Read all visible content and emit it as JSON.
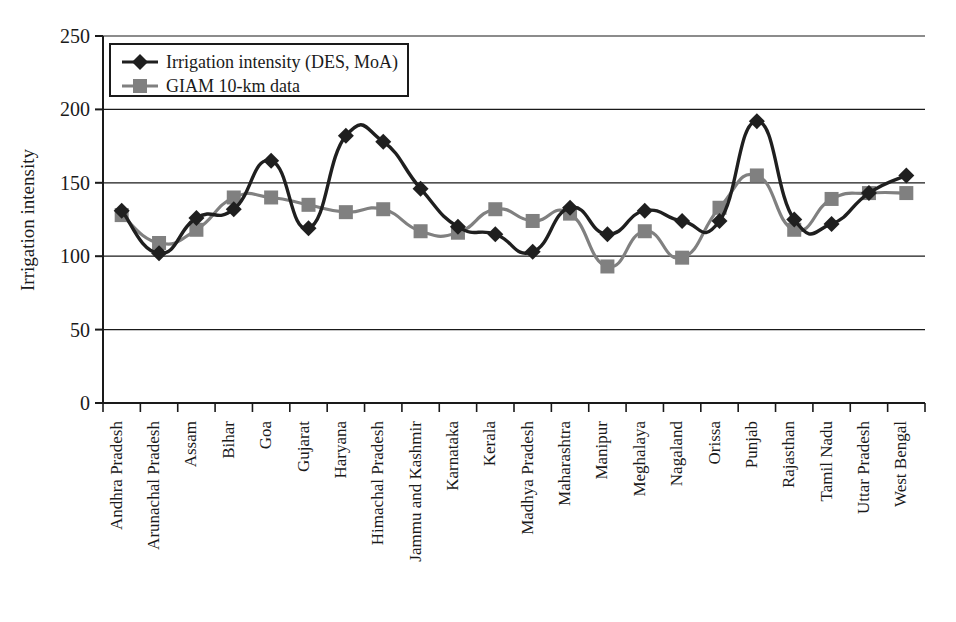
{
  "chart_data": {
    "type": "line",
    "title": "",
    "xlabel": "",
    "ylabel": "Irrigation intensity",
    "ylim": [
      0,
      250
    ],
    "yticks": [
      0,
      50,
      100,
      150,
      200,
      250
    ],
    "grid": true,
    "legend_position": "top-left",
    "categories": [
      "Andhra Pradesh",
      "Arunachal Pradesh",
      "Assam",
      "Bihar",
      "Goa",
      "Gujarat",
      "Haryana",
      "Himachal Pradesh",
      "Jammu and Kashmir",
      "Karnataka",
      "Kerala",
      "Madhya Pradesh",
      "Maharashtra",
      "Manipur",
      "Meghalaya",
      "Nagaland",
      "Orissa",
      "Punjab",
      "Rajasthan",
      "Tamil Nadu",
      "Uttar Pradesh",
      "West Bengal"
    ],
    "series": [
      {
        "name": "Irrigation intensity (DES, MoA)",
        "marker": "diamond",
        "color": "#1f1f1f",
        "values": [
          131,
          102,
          126,
          132,
          165,
          119,
          182,
          178,
          146,
          120,
          115,
          103,
          133,
          115,
          131,
          124,
          124,
          192,
          125,
          122,
          143,
          155
        ]
      },
      {
        "name": "GIAM 10-km data",
        "marker": "square",
        "color": "#808080",
        "values": [
          128,
          109,
          118,
          140,
          140,
          135,
          130,
          132,
          117,
          116,
          132,
          124,
          129,
          93,
          117,
          99,
          133,
          155,
          118,
          139,
          143,
          143
        ]
      }
    ]
  },
  "legend": {
    "entries": [
      {
        "label": "Irrigation intensity (DES, MoA)",
        "marker": "diamond",
        "color": "#1f1f1f"
      },
      {
        "label": "GIAM 10-km data",
        "marker": "square",
        "color": "#808080"
      }
    ]
  },
  "axes": {
    "y_title": "Irrigation intensity",
    "y_tick_labels": [
      "250",
      "200",
      "150",
      "100",
      "50",
      "0"
    ]
  }
}
